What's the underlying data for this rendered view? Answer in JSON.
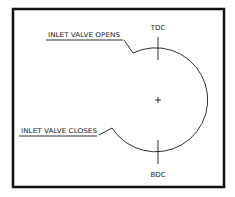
{
  "diagram": {
    "labels": {
      "tdc": "TDC",
      "bdc": "BDC",
      "inlet_opens": "INLET VALVE OPENS",
      "inlet_closes": "INLET VALVE CLOSES"
    },
    "center_marker": "+",
    "colors": {
      "line": "#1a1a1a",
      "frame": "#111111",
      "background": "#ffffff"
    }
  }
}
